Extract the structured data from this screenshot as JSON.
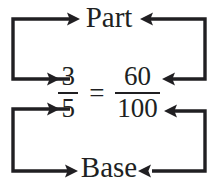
{
  "diagram": {
    "type": "proportion-bracket-diagram",
    "title_top": "Part",
    "title_bottom": "Base",
    "equation": {
      "left_fraction": {
        "numerator": "3",
        "denominator": "5"
      },
      "operator": "=",
      "right_fraction": {
        "numerator": "60",
        "denominator": "100"
      }
    },
    "colors": {
      "ink": "#201f22",
      "background": "#ffffff"
    },
    "connectors": [
      {
        "name": "left-numerator-to-part",
        "from": "3",
        "to": "Part",
        "arrow_heads": 2,
        "side": "left"
      },
      {
        "name": "right-numerator-to-part",
        "from": "60",
        "to": "Part",
        "arrow_heads": 2,
        "side": "right"
      },
      {
        "name": "left-denominator-to-base",
        "from": "5",
        "to": "Base",
        "arrow_heads": 2,
        "side": "left"
      },
      {
        "name": "right-denominator-to-base",
        "from": "100",
        "to": "Base",
        "arrow_heads": 2,
        "side": "right"
      }
    ]
  }
}
